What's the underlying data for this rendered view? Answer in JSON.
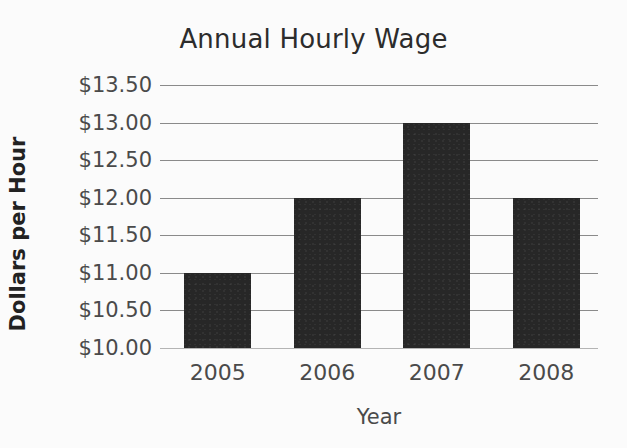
{
  "chart_data": {
    "type": "bar",
    "title": "Annual Hourly Wage",
    "xlabel": "Year",
    "ylabel": "Dollars per Hour",
    "categories": [
      "2005",
      "2006",
      "2007",
      "2008"
    ],
    "values": [
      11.0,
      12.0,
      13.0,
      12.0
    ],
    "value_labels": [
      "$11.00",
      "$12.00",
      "$13.00",
      "$12.00"
    ],
    "series": [
      {
        "name": "Annual Hourly Wage",
        "values": [
          11.0,
          12.0,
          13.0,
          12.0
        ]
      }
    ],
    "ylim": [
      10.0,
      13.5
    ],
    "ytick_values": [
      13.5,
      13.0,
      12.5,
      12.0,
      11.5,
      11.0,
      10.5,
      10.0
    ],
    "ytick_labels": [
      "$13.50",
      "$13.00",
      "$12.50",
      "$12.00",
      "$11.50",
      "$11.00",
      "$10.50",
      "$10.00"
    ],
    "ytick_step": 0.5,
    "grid": true,
    "grid_axis": "y",
    "legend": false,
    "legend_position": "none",
    "bar_color": "#272727",
    "grid_color": "#8a8a8a",
    "background_color": "#fbfbfb",
    "text_color": "#4a4a4a",
    "title_color": "#2c2c2c"
  },
  "figure": {
    "title": "Annual Hourly Wage",
    "x_axis_title": "Year",
    "y_axis_title": "Dollars per Hour"
  },
  "y_ticks": [
    {
      "label": "$13.50",
      "value": 13.5
    },
    {
      "label": "$13.00",
      "value": 13.0
    },
    {
      "label": "$12.50",
      "value": 12.5
    },
    {
      "label": "$12.00",
      "value": 12.0
    },
    {
      "label": "$11.50",
      "value": 11.5
    },
    {
      "label": "$11.00",
      "value": 11.0
    },
    {
      "label": "$10.50",
      "value": 10.5
    },
    {
      "label": "$10.00",
      "value": 10.0
    }
  ],
  "bars": [
    {
      "label": "2005",
      "value": 11.0
    },
    {
      "label": "2006",
      "value": 12.0
    },
    {
      "label": "2007",
      "value": 13.0
    },
    {
      "label": "2008",
      "value": 12.0
    }
  ]
}
